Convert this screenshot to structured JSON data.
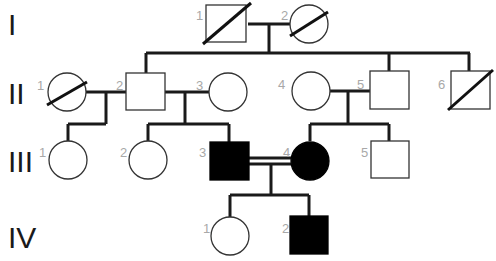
{
  "diagram": {
    "type": "pedigree",
    "generations": [
      {
        "label": "I",
        "y": 24
      },
      {
        "label": "II",
        "y": 92
      },
      {
        "label": "III",
        "y": 160
      },
      {
        "label": "IV",
        "y": 236
      }
    ],
    "individuals": [
      {
        "id": "I-1",
        "num": "1",
        "sex": "male",
        "affected": false,
        "deceased": true
      },
      {
        "id": "I-2",
        "num": "2",
        "sex": "female",
        "affected": false,
        "deceased": true
      },
      {
        "id": "II-1",
        "num": "1",
        "sex": "female",
        "affected": false,
        "deceased": true
      },
      {
        "id": "II-2",
        "num": "2",
        "sex": "male",
        "affected": false,
        "deceased": false
      },
      {
        "id": "II-3",
        "num": "3",
        "sex": "female",
        "affected": false,
        "deceased": false
      },
      {
        "id": "II-4",
        "num": "4",
        "sex": "female",
        "affected": false,
        "deceased": false
      },
      {
        "id": "II-5",
        "num": "5",
        "sex": "male",
        "affected": false,
        "deceased": false
      },
      {
        "id": "II-6",
        "num": "6",
        "sex": "male",
        "affected": false,
        "deceased": true
      },
      {
        "id": "III-1",
        "num": "1",
        "sex": "female",
        "affected": false,
        "deceased": false
      },
      {
        "id": "III-2",
        "num": "2",
        "sex": "female",
        "affected": false,
        "deceased": false
      },
      {
        "id": "III-3",
        "num": "3",
        "sex": "male",
        "affected": true,
        "deceased": false
      },
      {
        "id": "III-4",
        "num": "4",
        "sex": "female",
        "affected": true,
        "deceased": false
      },
      {
        "id": "III-5",
        "num": "5",
        "sex": "male",
        "affected": false,
        "deceased": false
      },
      {
        "id": "IV-1",
        "num": "1",
        "sex": "female",
        "affected": false,
        "deceased": false
      },
      {
        "id": "IV-2",
        "num": "2",
        "sex": "male",
        "affected": true,
        "deceased": false
      }
    ],
    "unions": [
      {
        "partners": [
          "I-1",
          "I-2"
        ],
        "consanguineous": false,
        "children": [
          "II-2",
          "II-5",
          "II-6"
        ]
      },
      {
        "partners": [
          "II-1",
          "II-2"
        ],
        "consanguineous": false,
        "children": [
          "III-1"
        ]
      },
      {
        "partners": [
          "II-2",
          "II-3"
        ],
        "consanguineous": false,
        "children": [
          "III-2",
          "III-3"
        ]
      },
      {
        "partners": [
          "II-4",
          "II-5"
        ],
        "consanguineous": false,
        "children": [
          "III-4",
          "III-5"
        ]
      },
      {
        "partners": [
          "III-3",
          "III-4"
        ],
        "consanguineous": true,
        "children": [
          "IV-1",
          "IV-2"
        ]
      }
    ],
    "colors": {
      "line": "#1a1a1a",
      "affected_fill": "#000000",
      "unaffected_fill": "#ffffff",
      "number_label": "#a8a8a8"
    }
  }
}
